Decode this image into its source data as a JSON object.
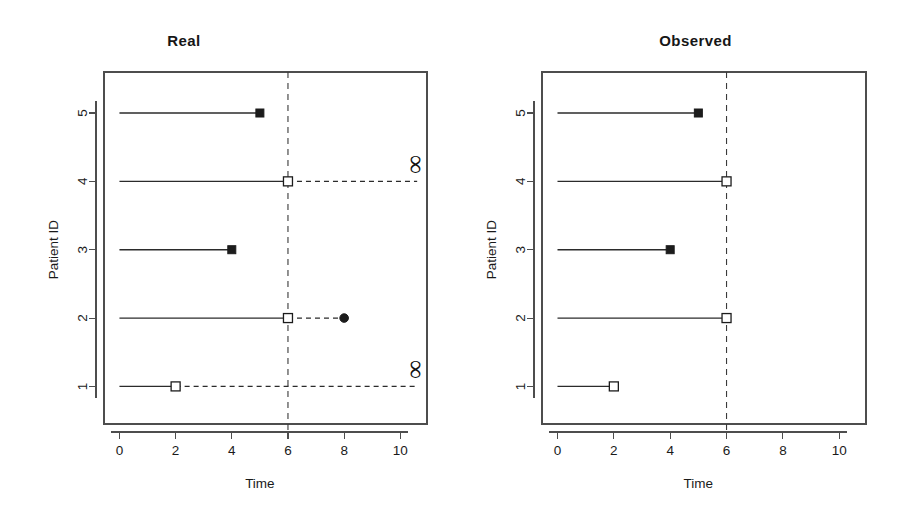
{
  "figure": {
    "width": 901,
    "height": 524,
    "background": "#ffffff",
    "ink_color": "#1c1c1c"
  },
  "chart_data": {
    "type": "scatter",
    "title": "",
    "panels": [
      {
        "key": "real",
        "title": "Real",
        "xlabel": "Time",
        "ylabel": "Patient ID",
        "xlim": [
          -0.55,
          10.95
        ],
        "ylim": [
          0.45,
          5.6
        ],
        "xticks": [
          0,
          2,
          4,
          6,
          8,
          10
        ],
        "xtick_labels": [
          "0",
          "2",
          "4",
          "6",
          "8",
          "10"
        ],
        "yticks": [
          1,
          2,
          3,
          4,
          5
        ],
        "ytick_labels": [
          "1",
          "2",
          "3",
          "4",
          "5"
        ],
        "grid": false,
        "reference_line": {
          "x": 6,
          "style": "dashed",
          "label": ""
        },
        "subjects": [
          {
            "id": 5,
            "solid_from": 0,
            "solid_to": 5,
            "dashed_from": null,
            "dashed_to": null,
            "end_marker": "filled-square",
            "end_marker_x": 5,
            "infinity": false
          },
          {
            "id": 4,
            "solid_from": 0,
            "solid_to": 6,
            "dashed_from": 6,
            "dashed_to": 10.6,
            "end_marker": "open-square",
            "end_marker_x": 6,
            "infinity": true
          },
          {
            "id": 3,
            "solid_from": 0,
            "solid_to": 4,
            "dashed_from": null,
            "dashed_to": null,
            "end_marker": "filled-square",
            "end_marker_x": 4,
            "infinity": false
          },
          {
            "id": 2,
            "solid_from": 0,
            "solid_to": 6,
            "dashed_from": 6,
            "dashed_to": 8,
            "end_marker": "open-square",
            "end_marker_x": 6,
            "terminal_marker": "filled-circle",
            "terminal_marker_x": 8,
            "infinity": false
          },
          {
            "id": 1,
            "solid_from": 0,
            "solid_to": 2,
            "dashed_from": 2,
            "dashed_to": 10.6,
            "end_marker": "open-square",
            "end_marker_x": 2,
            "infinity": true
          }
        ]
      },
      {
        "key": "observed",
        "title": "Observed",
        "xlabel": "Time",
        "ylabel": "Patient ID",
        "xlim": [
          -0.55,
          10.95
        ],
        "ylim": [
          0.45,
          5.6
        ],
        "xticks": [
          0,
          2,
          4,
          6,
          8,
          10
        ],
        "xtick_labels": [
          "0",
          "2",
          "4",
          "6",
          "8",
          "10"
        ],
        "yticks": [
          1,
          2,
          3,
          4,
          5
        ],
        "ytick_labels": [
          "1",
          "2",
          "3",
          "4",
          "5"
        ],
        "grid": false,
        "reference_line": {
          "x": 6,
          "style": "dashed",
          "label": ""
        },
        "subjects": [
          {
            "id": 5,
            "solid_from": 0,
            "solid_to": 5,
            "dashed_from": null,
            "dashed_to": null,
            "end_marker": "filled-square",
            "end_marker_x": 5,
            "infinity": false
          },
          {
            "id": 4,
            "solid_from": 0,
            "solid_to": 6,
            "dashed_from": null,
            "dashed_to": null,
            "end_marker": "open-square",
            "end_marker_x": 6,
            "infinity": false
          },
          {
            "id": 3,
            "solid_from": 0,
            "solid_to": 4,
            "dashed_from": null,
            "dashed_to": null,
            "end_marker": "filled-square",
            "end_marker_x": 4,
            "infinity": false
          },
          {
            "id": 2,
            "solid_from": 0,
            "solid_to": 6,
            "dashed_from": null,
            "dashed_to": null,
            "end_marker": "open-square",
            "end_marker_x": 6,
            "infinity": false
          },
          {
            "id": 1,
            "solid_from": 0,
            "solid_to": 2,
            "dashed_from": null,
            "dashed_to": null,
            "end_marker": "open-square",
            "end_marker_x": 2,
            "infinity": false
          }
        ]
      }
    ],
    "legend": {
      "visible": false,
      "entries": []
    },
    "symbols": {
      "infinity": "∞",
      "filled_square": "■",
      "open_square": "□",
      "filled_circle": "●"
    }
  }
}
